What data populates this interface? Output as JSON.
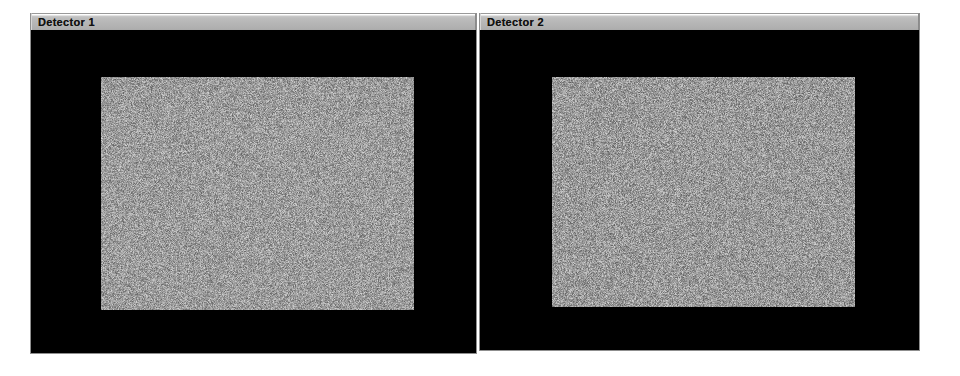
{
  "page": {
    "background_color": "#ffffff",
    "width": 960,
    "height": 376
  },
  "panels": [
    {
      "id": "detector-1",
      "title": "Detector 1",
      "titlebar_color": "#b6b6b6",
      "canvas_color": "#000000",
      "image": {
        "name": "detector-1-noise-frame",
        "type": "grayscale-noise",
        "mean_gray": "#9c9c9c",
        "noise_amplitude": 58,
        "seed": 1337
      }
    },
    {
      "id": "detector-2",
      "title": "Detector 2",
      "titlebar_color": "#b6b6b6",
      "canvas_color": "#000000",
      "image": {
        "name": "detector-2-noise-frame",
        "type": "grayscale-noise",
        "mean_gray": "#9a9a9a",
        "noise_amplitude": 60,
        "seed": 90210
      }
    }
  ]
}
